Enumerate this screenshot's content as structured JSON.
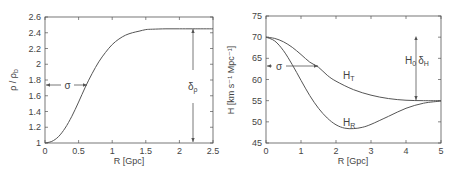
{
  "chart_data": [
    {
      "type": "line",
      "title": "",
      "xlabel": "R [Gpc]",
      "ylabel": "ρ / ρ_b",
      "xlim": [
        0,
        2.5
      ],
      "ylim": [
        1,
        2.6
      ],
      "xticks": [
        "0",
        "0.5",
        "1",
        "1.5",
        "2",
        "2.5"
      ],
      "yticks": [
        "1",
        "1.2",
        "1.4",
        "1.6",
        "1.8",
        "2",
        "2.2",
        "2.4",
        "2.6"
      ],
      "grid": false,
      "series": [
        {
          "name": "ρ/ρ_b",
          "x": [
            0,
            0.1,
            0.2,
            0.3,
            0.4,
            0.5,
            0.6,
            0.7,
            0.8,
            0.9,
            1.0,
            1.1,
            1.2,
            1.3,
            1.4,
            1.5,
            1.6,
            1.8,
            2.0,
            2.2,
            2.5
          ],
          "y": [
            1.0,
            1.02,
            1.08,
            1.19,
            1.34,
            1.52,
            1.71,
            1.88,
            2.03,
            2.15,
            2.25,
            2.32,
            2.37,
            2.4,
            2.42,
            2.44,
            2.445,
            2.45,
            2.45,
            2.45,
            2.45
          ]
        }
      ],
      "annotations": [
        {
          "label": "σ",
          "type": "horizontal-arrow",
          "y": 1.72,
          "x_from": 0,
          "x_to": 0.62
        },
        {
          "label": "δ_ρ",
          "type": "vertical-arrow",
          "x": 2.2,
          "y_from": 1.0,
          "y_to": 2.45
        }
      ]
    },
    {
      "type": "line",
      "title": "",
      "xlabel": "R [Gpc]",
      "ylabel": "H [km s⁻¹ Mpc⁻¹]",
      "xlim": [
        0,
        5
      ],
      "ylim": [
        45,
        75
      ],
      "xticks": [
        "0",
        "1",
        "2",
        "3",
        "4",
        "5"
      ],
      "yticks": [
        "45",
        "50",
        "55",
        "60",
        "65",
        "70",
        "75"
      ],
      "grid": false,
      "series": [
        {
          "name": "H_T",
          "x": [
            0,
            0.25,
            0.5,
            0.75,
            1.0,
            1.25,
            1.5,
            1.75,
            2.0,
            2.5,
            3.0,
            3.5,
            4.0,
            4.5,
            5.0
          ],
          "y": [
            70.0,
            69.7,
            68.9,
            67.6,
            65.9,
            64.1,
            62.9,
            61.0,
            59.6,
            57.6,
            56.3,
            55.5,
            55.1,
            55.0,
            55.0
          ]
        },
        {
          "name": "H_R",
          "x": [
            0,
            0.25,
            0.5,
            0.75,
            1.0,
            1.25,
            1.5,
            1.75,
            2.0,
            2.25,
            2.5,
            2.75,
            3.0,
            3.5,
            4.0,
            4.5,
            5.0
          ],
          "y": [
            70.0,
            69.1,
            66.8,
            63.5,
            59.8,
            56.2,
            53.2,
            50.9,
            49.3,
            48.5,
            48.4,
            48.7,
            49.4,
            51.3,
            53.2,
            54.4,
            54.9
          ]
        }
      ],
      "annotations": [
        {
          "label": "σ",
          "type": "horizontal-arrow",
          "y": 63,
          "x_from": 0,
          "x_to": 1.5
        },
        {
          "label": "H_0 δ_H",
          "type": "vertical-arrow",
          "x": 4.3,
          "y_from": 55,
          "y_to": 68
        },
        {
          "label": "H_T",
          "x": 2.25,
          "y": 60.5
        },
        {
          "label": "H_R",
          "x": 2.3,
          "y": 49.5
        }
      ]
    }
  ],
  "left": {
    "xlabel": "R [Gpc]",
    "ylabel_main": "ρ / ρ",
    "ylabel_sub": "b",
    "xticks": [
      "0",
      "0.5",
      "1",
      "1.5",
      "2",
      "2.5"
    ],
    "yticks": [
      "1",
      "1.2",
      "1.4",
      "1.6",
      "1.8",
      "2",
      "2.2",
      "2.4",
      "2.6"
    ],
    "sigma": "σ",
    "delta_main": "δ",
    "delta_sub": "ρ"
  },
  "right": {
    "xlabel": "R [Gpc]",
    "ylabel": "H [km s⁻¹ Mpc⁻¹]",
    "xticks": [
      "0",
      "1",
      "2",
      "3",
      "4",
      "5"
    ],
    "yticks": [
      "45",
      "50",
      "55",
      "60",
      "65",
      "70",
      "75"
    ],
    "sigma": "σ",
    "ht_main": "H",
    "ht_sub": "T",
    "hr_main": "H",
    "hr_sub": "R",
    "h0_main": "H",
    "h0_sub": "0",
    "dh_main": "δ",
    "dh_sub": "H"
  }
}
